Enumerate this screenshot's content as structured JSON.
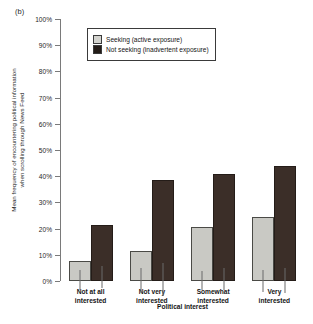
{
  "figure": {
    "panel_label": "(b)"
  },
  "legend": {
    "position": "top-left-inside",
    "items": [
      {
        "label": "Seeking (active exposure)",
        "color": "#d3d3ce",
        "key": "seeking"
      },
      {
        "label": "Not seeking (inadvertent exposure)",
        "color": "#241c18",
        "key": "not_seeking"
      }
    ]
  },
  "chart_data": {
    "type": "bar",
    "title": "",
    "subtitle": "",
    "xlabel": "Political interest",
    "ylabel": "Mean frequency of encountering political information when scrolling through News Feed",
    "ylabel_lines": [
      "Mean frequency of encountering political information",
      "when scrolling through News Feed"
    ],
    "categories": [
      "Not at all interested",
      "Not very interested",
      "Somewhat interested",
      "Very interested"
    ],
    "category_lines": [
      [
        "Not at all",
        "interested"
      ],
      [
        "Not very",
        "interested"
      ],
      [
        "Somewhat",
        "interested"
      ],
      [
        "Very",
        "interested"
      ]
    ],
    "series": [
      {
        "name": "Seeking (active exposure)",
        "color": "#c9c9c4",
        "values": [
          7.5,
          11.5,
          20.5,
          24.5
        ],
        "error_low": [
          3.5,
          6.5,
          16.5,
          20.0
        ],
        "error_high": [
          11.5,
          16.0,
          24.0,
          28.5
        ]
      },
      {
        "name": "Not seeking (inadvertent exposure)",
        "color": "#3b2e28",
        "values": [
          21.5,
          38.5,
          41.0,
          44.0
        ],
        "error_low": [
          18.5,
          32.5,
          37.0,
          39.0
        ],
        "error_high": [
          27.0,
          45.0,
          45.5,
          48.5
        ]
      }
    ],
    "ylim": [
      0,
      100
    ],
    "yticks": [
      0,
      10,
      20,
      30,
      40,
      50,
      60,
      70,
      80,
      90,
      100
    ],
    "ytick_labels": [
      "0%",
      "10%",
      "20%",
      "30%",
      "40%",
      "50%",
      "60%",
      "70%",
      "80%",
      "90%",
      "100%"
    ],
    "grid": false,
    "units": "percent",
    "error_bars": true
  }
}
